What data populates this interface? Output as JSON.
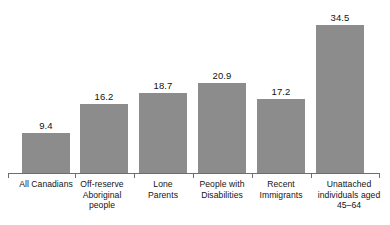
{
  "chart_data": {
    "type": "bar",
    "title": "",
    "subtitle": "",
    "xlabel": "",
    "ylabel": "",
    "ylim": [
      0,
      34.5
    ],
    "grid": false,
    "legend": false,
    "axis": {
      "show_y_axis": false,
      "show_x_axis": true,
      "ticks_between_categories": true
    },
    "bar_color": "#8c8c8c",
    "axis_color": "#6d6d6d",
    "text_color": "#141414",
    "value_label_format": "one-decimal",
    "categories": [
      "All Canadians",
      "Off-reserve Aboriginal people",
      "Lone Parents",
      "People with Disabilities",
      "Recent Immigrants",
      "Unattached individuals aged 45–64"
    ],
    "category_lines": [
      [
        "All Canadians"
      ],
      [
        "Off-reserve",
        "Aboriginal",
        "people"
      ],
      [
        "Lone",
        "Parents"
      ],
      [
        "People with",
        "Disabilities"
      ],
      [
        "Recent",
        "Immigrants"
      ],
      [
        "Unattached",
        "individuals aged",
        "45–64"
      ]
    ],
    "values": [
      9.4,
      16.2,
      18.7,
      20.9,
      17.2,
      34.5
    ],
    "value_labels": [
      "9.4",
      "16.2",
      "18.7",
      "20.9",
      "17.2",
      "34.5"
    ]
  }
}
